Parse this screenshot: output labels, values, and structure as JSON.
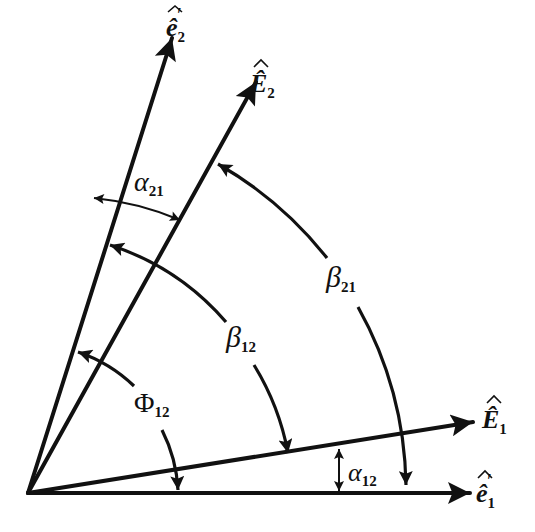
{
  "diagram": {
    "title": "",
    "vectors": [
      {
        "id": "e1_prime",
        "symbol": "ê",
        "subscript": "1",
        "prime": "′",
        "label": "ê₁′"
      },
      {
        "id": "E1",
        "symbol": "Ê",
        "subscript": "1",
        "prime": "",
        "label": "Ê₁"
      },
      {
        "id": "E2",
        "symbol": "Ê",
        "subscript": "2",
        "prime": "",
        "label": "Ê₂"
      },
      {
        "id": "e2_prime",
        "symbol": "ê",
        "subscript": "2",
        "prime": "′",
        "label": "ê₂′"
      }
    ],
    "angles": [
      {
        "id": "alpha21",
        "symbol": "α",
        "subscript": "21",
        "label": "α₂₁",
        "from": "e2_prime",
        "to": "E2"
      },
      {
        "id": "beta21",
        "symbol": "β",
        "subscript": "21",
        "label": "β₂₁",
        "from": "e1_prime",
        "to": "E2"
      },
      {
        "id": "beta12",
        "symbol": "β",
        "subscript": "12",
        "label": "β₁₂",
        "from": "E1",
        "to": "e2_prime"
      },
      {
        "id": "phi12",
        "symbol": "Φ",
        "subscript": "12",
        "label": "Φ₁₂",
        "from": "e1_prime",
        "to": "e2_prime"
      },
      {
        "id": "alpha12",
        "symbol": "α",
        "subscript": "12",
        "label": "α₁₂",
        "from": "e1_prime",
        "to": "E1"
      }
    ],
    "colors": {
      "ink": "#111111",
      "background": "#ffffff"
    }
  }
}
